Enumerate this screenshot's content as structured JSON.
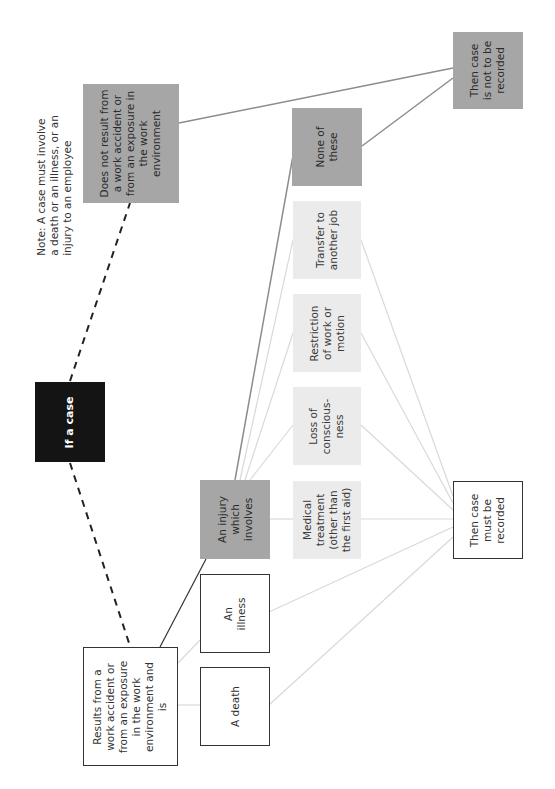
{
  "diagram": {
    "orientation": "rotated -90deg",
    "colors": {
      "black": "#141414",
      "gray": "#a6a6a6",
      "light": "#ebebeb",
      "white": "#ffffff",
      "line_dark": "#333333",
      "line_gray": "#8c8c8c",
      "line_light": "#d9d9d9"
    },
    "note": "Note: A case must involve\na death or an illness, or an\ninjury to an employee",
    "nodes": {
      "if_case": "If a case",
      "not_work": "Does not result from\na work accident or\nfrom an exposure in\nthe work\nenvironment",
      "results_from": "Results from a\nwork accident or\nfrom an exposure\nin the work\nenvironment and\nis",
      "a_death": "A death",
      "an_illness": "An\nillness",
      "an_injury": "An injury\nwhich\ninvolves",
      "medical": "Medical\ntreatment\n(other than\nthe first aid)",
      "loss": "Loss of\nconscious-\nness",
      "restriction": "Restriction\nof work or\nmotion",
      "transfer": "Transfer to\nanother job",
      "none": "None of\nthese",
      "must_record": "Then case\nmust be\nrecorded",
      "not_record": "Then case\nis not to be\nrecorded"
    },
    "edges": [
      {
        "from": "if_case",
        "to": "not_work",
        "style": "dashed"
      },
      {
        "from": "if_case",
        "to": "results_from",
        "style": "dashed"
      },
      {
        "from": "not_work",
        "to": "not_record",
        "style": "solid-gray"
      },
      {
        "from": "results_from",
        "to": "a_death",
        "style": "light"
      },
      {
        "from": "results_from",
        "to": "an_illness",
        "style": "light"
      },
      {
        "from": "results_from",
        "to": "an_injury",
        "style": "solid-dark"
      },
      {
        "from": "an_injury",
        "to": "medical",
        "style": "light"
      },
      {
        "from": "an_injury",
        "to": "loss",
        "style": "light"
      },
      {
        "from": "an_injury",
        "to": "restriction",
        "style": "light"
      },
      {
        "from": "an_injury",
        "to": "transfer",
        "style": "light"
      },
      {
        "from": "an_injury",
        "to": "none",
        "style": "solid-gray"
      },
      {
        "from": "none",
        "to": "not_record",
        "style": "solid-gray"
      },
      {
        "from": "a_death",
        "to": "must_record",
        "style": "light"
      },
      {
        "from": "an_illness",
        "to": "must_record",
        "style": "light"
      },
      {
        "from": "medical",
        "to": "must_record",
        "style": "light"
      },
      {
        "from": "loss",
        "to": "must_record",
        "style": "light"
      },
      {
        "from": "restriction",
        "to": "must_record",
        "style": "light"
      },
      {
        "from": "transfer",
        "to": "must_record",
        "style": "light"
      }
    ]
  }
}
